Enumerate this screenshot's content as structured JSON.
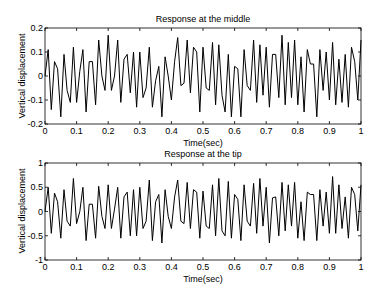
{
  "chart_data": [
    {
      "type": "line",
      "title": "Response at the middle",
      "xlabel": "Time(sec)",
      "ylabel": "Vertical displacement",
      "xlim": [
        0,
        1
      ],
      "ylim": [
        -0.2,
        0.2
      ],
      "xticks": [
        "0",
        "0.1",
        "0.2",
        "0.3",
        "0.4",
        "0.5",
        "0.6",
        "0.7",
        "0.8",
        "0.9",
        "1"
      ],
      "yticks": [
        "-0.2",
        "-0.1",
        "0",
        "0.1",
        "0.2"
      ],
      "grid": false,
      "legend": null,
      "series": [
        {
          "name": "middle",
          "x": [
            0,
            0.01,
            0.02,
            0.03,
            0.04,
            0.05,
            0.06,
            0.07,
            0.08,
            0.09,
            0.1,
            0.11,
            0.12,
            0.13,
            0.14,
            0.15,
            0.16,
            0.17,
            0.18,
            0.19,
            0.2,
            0.21,
            0.22,
            0.23,
            0.24,
            0.25,
            0.26,
            0.27,
            0.28,
            0.29,
            0.3,
            0.31,
            0.32,
            0.33,
            0.34,
            0.35,
            0.36,
            0.37,
            0.38,
            0.39,
            0.4,
            0.41,
            0.42,
            0.43,
            0.44,
            0.45,
            0.46,
            0.47,
            0.48,
            0.49,
            0.5,
            0.51,
            0.52,
            0.53,
            0.54,
            0.55,
            0.56,
            0.57,
            0.58,
            0.59,
            0.6,
            0.61,
            0.62,
            0.63,
            0.64,
            0.65,
            0.66,
            0.67,
            0.68,
            0.69,
            0.7,
            0.71,
            0.72,
            0.73,
            0.74,
            0.75,
            0.76,
            0.77,
            0.78,
            0.79,
            0.8,
            0.81,
            0.82,
            0.83,
            0.84,
            0.85,
            0.86,
            0.87,
            0.88,
            0.89,
            0.9,
            0.91,
            0.92,
            0.93,
            0.94,
            0.95,
            0.96,
            0.97,
            0.98,
            0.99,
            1.0
          ],
          "y": [
            0,
            0.11,
            -0.14,
            0.06,
            0.03,
            -0.17,
            0.09,
            -0.06,
            -0.11,
            0.12,
            -0.11,
            0.02,
            0.11,
            -0.15,
            0.06,
            0.06,
            -0.12,
            0.15,
            0.0,
            -0.06,
            0.17,
            -0.06,
            0.0,
            0.15,
            -0.11,
            0.07,
            0.09,
            -0.07,
            0.1,
            -0.13,
            0.1,
            -0.09,
            -0.05,
            0.12,
            -0.13,
            -0.02,
            0.04,
            -0.17,
            0.08,
            0.0,
            -0.1,
            0.06,
            0.16,
            -0.04,
            -0.03,
            0.15,
            -0.07,
            0.12,
            0.1,
            -0.15,
            0.12,
            -0.05,
            -0.06,
            0.14,
            -0.12,
            0.13,
            -0.08,
            -0.15,
            0.09,
            -0.17,
            0.04,
            0.03,
            -0.17,
            0.11,
            -0.04,
            -0.06,
            0.15,
            -0.11,
            0.13,
            -0.08,
            0.12,
            -0.13,
            0.09,
            0.09,
            -0.09,
            0.17,
            -0.12,
            0.14,
            -0.09,
            0.15,
            -0.12,
            0.08,
            -0.15,
            0.11,
            0.05,
            0.05,
            -0.17,
            0.11,
            -0.06,
            0.1,
            -0.1,
            0.14,
            -0.12,
            0.07,
            -0.11,
            0.09,
            -0.13,
            0.12,
            0.06,
            -0.1,
            0.15
          ]
        }
      ]
    },
    {
      "type": "line",
      "title": "Response at the tip",
      "xlabel": "Time(sec)",
      "ylabel": "Vertical displacement",
      "xlim": [
        0,
        1
      ],
      "ylim": [
        -1,
        1
      ],
      "xticks": [
        "0",
        "0.1",
        "0.2",
        "0.3",
        "0.4",
        "0.5",
        "0.6",
        "0.7",
        "0.8",
        "0.9",
        "1"
      ],
      "yticks": [
        "-1",
        "-0.5",
        "0",
        "0.5",
        "1"
      ],
      "grid": false,
      "legend": null,
      "series": [
        {
          "name": "tip",
          "x": [
            0,
            0.01,
            0.02,
            0.03,
            0.04,
            0.05,
            0.06,
            0.07,
            0.08,
            0.09,
            0.1,
            0.11,
            0.12,
            0.13,
            0.14,
            0.15,
            0.16,
            0.17,
            0.18,
            0.19,
            0.2,
            0.21,
            0.22,
            0.23,
            0.24,
            0.25,
            0.26,
            0.27,
            0.28,
            0.29,
            0.3,
            0.31,
            0.32,
            0.33,
            0.34,
            0.35,
            0.36,
            0.37,
            0.38,
            0.39,
            0.4,
            0.41,
            0.42,
            0.43,
            0.44,
            0.45,
            0.46,
            0.47,
            0.48,
            0.49,
            0.5,
            0.51,
            0.52,
            0.53,
            0.54,
            0.55,
            0.56,
            0.57,
            0.58,
            0.59,
            0.6,
            0.61,
            0.62,
            0.63,
            0.64,
            0.65,
            0.66,
            0.67,
            0.68,
            0.69,
            0.7,
            0.71,
            0.72,
            0.73,
            0.74,
            0.75,
            0.76,
            0.77,
            0.78,
            0.79,
            0.8,
            0.81,
            0.82,
            0.83,
            0.84,
            0.85,
            0.86,
            0.87,
            0.88,
            0.89,
            0.9,
            0.91,
            0.92,
            0.93,
            0.94,
            0.95,
            0.96,
            0.97,
            0.98,
            0.99,
            1.0
          ],
          "y": [
            0,
            0.5,
            -0.45,
            0.38,
            0.2,
            -0.55,
            0.45,
            -0.2,
            -0.3,
            0.68,
            -0.25,
            0.0,
            0.5,
            -0.6,
            0.15,
            0.15,
            -0.55,
            0.52,
            -0.1,
            -0.35,
            0.55,
            -0.35,
            0.05,
            0.5,
            -0.55,
            0.3,
            0.4,
            -0.5,
            0.45,
            -0.5,
            0.5,
            -0.35,
            -0.2,
            0.65,
            -0.6,
            0.2,
            0.35,
            -0.65,
            0.45,
            -0.1,
            -0.35,
            0.3,
            0.65,
            -0.2,
            -0.25,
            0.6,
            -0.35,
            0.45,
            0.4,
            -0.55,
            0.42,
            -0.3,
            -0.35,
            0.55,
            -0.5,
            0.68,
            -0.4,
            -0.5,
            0.62,
            -0.55,
            0.35,
            0.25,
            -0.6,
            0.55,
            -0.2,
            -0.3,
            0.58,
            -0.45,
            0.68,
            -0.3,
            0.5,
            -0.65,
            0.28,
            0.3,
            -0.5,
            0.6,
            -0.4,
            0.55,
            -0.3,
            0.6,
            -0.55,
            0.2,
            -0.6,
            0.4,
            0.35,
            0.35,
            -0.6,
            0.45,
            -0.3,
            0.4,
            -0.45,
            0.72,
            -0.45,
            0.55,
            -0.35,
            0.3,
            -0.55,
            0.5,
            0.35,
            -0.4,
            0.55
          ]
        }
      ]
    }
  ]
}
